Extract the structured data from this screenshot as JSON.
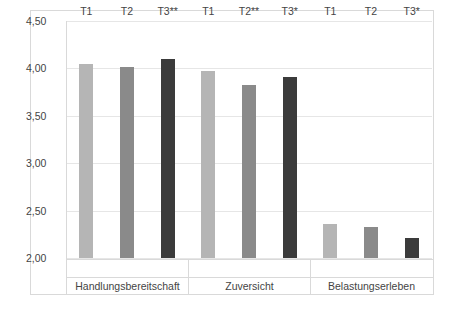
{
  "chart_data": {
    "type": "bar",
    "title": "",
    "xlabel": "",
    "ylabel": "",
    "ylim": [
      2.0,
      4.5
    ],
    "ytick_labels": [
      "4,50",
      "4,00",
      "3,50",
      "3,00",
      "2,50",
      "2,00"
    ],
    "ytick_values": [
      4.5,
      4.0,
      3.5,
      3.0,
      2.5,
      2.0
    ],
    "grid": true,
    "legend": "none",
    "decimal_separator": ",",
    "groups": [
      {
        "name": "Handlungsbereitschaft",
        "categories": [
          "T1",
          "T2",
          "T3**"
        ],
        "values": [
          4.05,
          4.02,
          4.1
        ],
        "colors": [
          "#b5b5b5",
          "#8a8a8a",
          "#3b3b3b"
        ]
      },
      {
        "name": "Zuversicht",
        "categories": [
          "T1",
          "T2**",
          "T3*"
        ],
        "values": [
          3.97,
          3.82,
          3.91
        ],
        "colors": [
          "#b5b5b5",
          "#8a8a8a",
          "#3b3b3b"
        ]
      },
      {
        "name": "Belastungserleben",
        "categories": [
          "T1",
          "T2",
          "T3*"
        ],
        "values": [
          2.36,
          2.33,
          2.21
        ],
        "colors": [
          "#b5b5b5",
          "#8a8a8a",
          "#3b3b3b"
        ]
      }
    ],
    "series_colors": {
      "T1": "#b5b5b5",
      "T2": "#8a8a8a",
      "T3": "#3b3b3b"
    },
    "axis_color": "#d9d9d9",
    "gridline_color": "#e6e6e6",
    "text_color": "#444444",
    "background": "#ffffff"
  }
}
